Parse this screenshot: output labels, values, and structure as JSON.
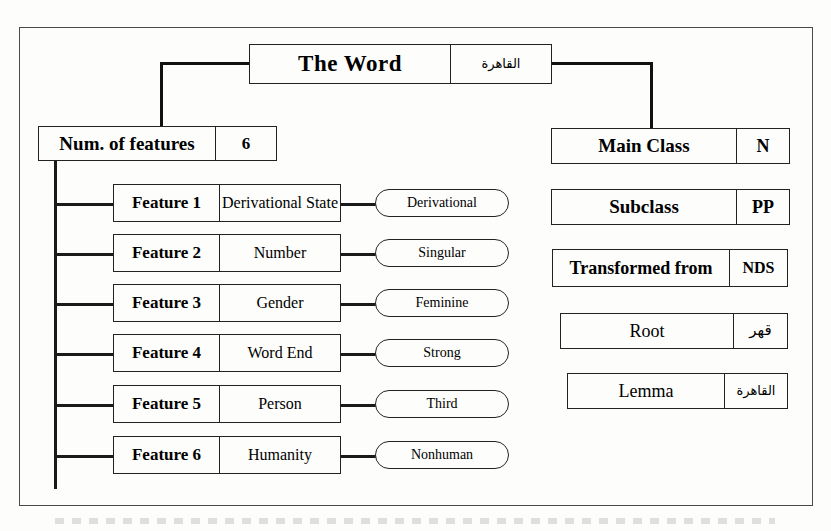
{
  "diagram": {
    "title_box": {
      "label": "The Word",
      "value": "القاهرة"
    },
    "num_features_box": {
      "label": "Num. of features",
      "value": "6"
    },
    "features": [
      {
        "label": "Feature 1",
        "name": "Derivational State",
        "value": "Derivational"
      },
      {
        "label": "Feature 2",
        "name": "Number",
        "value": "Singular"
      },
      {
        "label": "Feature 3",
        "name": "Gender",
        "value": "Feminine"
      },
      {
        "label": "Feature 4",
        "name": "Word End",
        "value": "Strong"
      },
      {
        "label": "Feature 5",
        "name": "Person",
        "value": "Third"
      },
      {
        "label": "Feature 6",
        "name": "Humanity",
        "value": "Nonhuman"
      }
    ],
    "attributes": [
      {
        "label": "Main Class",
        "value": "N"
      },
      {
        "label": "Subclass",
        "value": "PP"
      },
      {
        "label": "Transformed from",
        "value": "NDS"
      },
      {
        "label": "Root",
        "value": "قهر"
      },
      {
        "label": "Lemma",
        "value": "القاهرة"
      }
    ],
    "colors": {
      "line": "#111111",
      "border": "#222222",
      "frame": "#4a4a4a",
      "background": "#fdfdfc"
    }
  }
}
